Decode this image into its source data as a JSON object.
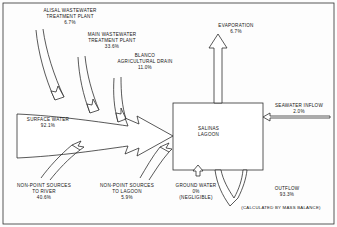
{
  "figure": {
    "line_color": "#222222",
    "text_color": "#141414",
    "background": "#fdfdfd"
  },
  "central_node": {
    "name": "salinas-lagoon",
    "line1": "SALINAS",
    "line2": "LAGOON"
  },
  "inputs": [
    {
      "id": "alisal-wastewater-treatment-plant",
      "line1": "ALISAL WASTEWATER",
      "line2": "TREATMENT PLANT",
      "value": "6.7%",
      "percent": 6.7,
      "direction": "into-surface-water"
    },
    {
      "id": "main-wastewater-treatment-plant",
      "line1": "MAIN WASTEWATER",
      "line2": "TREATMENT PLANT",
      "value": "33.6%",
      "percent": 33.6,
      "direction": "into-surface-water"
    },
    {
      "id": "blanco-agricultural-drain",
      "line1": "BLANCO",
      "line2": "AGRICULTURAL DRAIN",
      "value": "11.0%",
      "percent": 11.0,
      "direction": "into-surface-water"
    },
    {
      "id": "non-point-sources-to-river",
      "line1": "NON-POINT SOURCES",
      "line2": "TO RIVER",
      "value": "40.6%",
      "percent": 40.6,
      "direction": "into-surface-water"
    },
    {
      "id": "surface-water",
      "line1": "SURFACE WATER",
      "line2": "",
      "value": "92.1%",
      "percent": 92.1,
      "direction": "into-lagoon"
    },
    {
      "id": "non-point-sources-to-lagoon",
      "line1": "NON-POINT SOURCES",
      "line2": "TO LAGOON",
      "value": "5.9%",
      "percent": 5.9,
      "direction": "into-lagoon"
    },
    {
      "id": "ground-water",
      "line1": "GROUND WATER",
      "line2": "",
      "value": "0%",
      "note": "(NEGLIGIBLE)",
      "percent": 0,
      "direction": "into-lagoon"
    },
    {
      "id": "seawater-inflow",
      "line1": "SEAWATER INFLOW",
      "line2": "",
      "value": "2.0%",
      "percent": 2.0,
      "direction": "into-lagoon"
    }
  ],
  "outputs": [
    {
      "id": "evaporation",
      "line1": "EVAPORATION",
      "line2": "",
      "value": "6.7%",
      "percent": 6.7,
      "direction": "out-of-lagoon"
    },
    {
      "id": "outflow",
      "line1": "OUTFLOW",
      "line2": "",
      "value": "93.3%",
      "percent": 93.3,
      "note": "(CALCULATED BY MASS BALANCE)",
      "direction": "out-of-lagoon"
    }
  ]
}
